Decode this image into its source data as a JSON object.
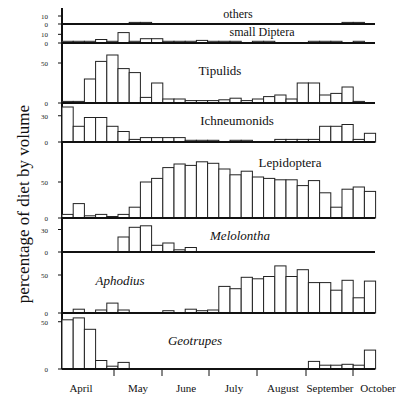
{
  "chart_data": {
    "type": "bar",
    "title": "",
    "xlabel": "",
    "ylabel": "percentage of diet by volume",
    "x_months": [
      "April",
      "May",
      "June",
      "July",
      "August",
      "September",
      "October"
    ],
    "bin_note": "approximately weekly bins from early April to mid October",
    "panels": [
      {
        "name": "others",
        "italic": false,
        "yticks": [
          0,
          10
        ],
        "ymax": 15,
        "values": [
          0,
          0,
          0,
          0,
          0,
          0,
          2,
          2,
          0,
          0,
          0,
          0,
          0,
          0,
          0,
          0,
          0,
          0,
          0,
          0,
          0,
          0,
          0,
          0,
          0,
          2,
          2,
          0,
          2,
          0
        ]
      },
      {
        "name": "small Diptera",
        "italic": false,
        "yticks": [
          0,
          10
        ],
        "ymax": 15,
        "values": [
          2,
          2,
          2,
          4,
          2,
          12,
          2,
          5,
          5,
          2,
          2,
          2,
          3,
          2,
          2,
          2,
          0,
          2,
          2,
          0,
          0,
          0,
          2,
          2,
          2,
          0,
          2,
          0
        ]
      },
      {
        "name": "Tipulids",
        "italic": false,
        "yticks": [
          0,
          50
        ],
        "ymax": 70,
        "values": [
          2,
          2,
          30,
          52,
          60,
          43,
          38,
          7,
          25,
          5,
          5,
          3,
          3,
          3,
          4,
          6,
          3,
          5,
          8,
          10,
          5,
          25,
          25,
          10,
          12,
          20,
          2,
          0
        ]
      },
      {
        "name": "Ichneumonids",
        "italic": false,
        "yticks": [
          0,
          30
        ],
        "ymax": 40,
        "values": [
          40,
          18,
          28,
          28,
          18,
          12,
          3,
          5,
          5,
          5,
          5,
          2,
          2,
          2,
          0,
          2,
          2,
          0,
          0,
          3,
          3,
          3,
          3,
          18,
          18,
          20,
          3,
          10,
          32
        ]
      },
      {
        "name": "Lepidoptera",
        "italic": false,
        "yticks": [
          0,
          50
        ],
        "ymax": 100,
        "values": [
          5,
          20,
          3,
          5,
          1,
          5,
          15,
          50,
          55,
          70,
          75,
          73,
          78,
          76,
          68,
          60,
          65,
          57,
          55,
          53,
          53,
          45,
          52,
          35,
          15,
          40,
          43,
          37,
          12
        ]
      },
      {
        "name": "Melolontha",
        "italic": true,
        "yticks": [
          0,
          30
        ],
        "ymax": 40,
        "values": [
          0,
          0,
          0,
          0,
          0,
          20,
          33,
          35,
          9,
          12,
          3,
          6,
          0,
          0,
          0,
          0,
          0,
          0,
          0,
          0,
          0,
          0,
          0,
          0,
          0,
          0,
          0,
          0,
          0
        ]
      },
      {
        "name": "Aphodius",
        "italic": true,
        "yticks": [
          0,
          50
        ],
        "ymax": 75,
        "values": [
          0,
          5,
          0,
          4,
          13,
          4,
          0,
          0,
          0,
          3,
          0,
          5,
          3,
          4,
          35,
          32,
          47,
          45,
          48,
          62,
          48,
          57,
          40,
          40,
          30,
          43,
          20,
          42,
          0
        ]
      },
      {
        "name": "Geotrupes",
        "italic": true,
        "yticks": [
          0,
          50
        ],
        "ymax": 55,
        "values": [
          52,
          54,
          42,
          9,
          3,
          7,
          0,
          0,
          0,
          0,
          0,
          0,
          0,
          0,
          0,
          0,
          0,
          0,
          0,
          0,
          0,
          0,
          8,
          4,
          4,
          5,
          4,
          20,
          14
        ]
      }
    ]
  },
  "labels": {
    "ylabel": "percentage of diet by volume"
  }
}
